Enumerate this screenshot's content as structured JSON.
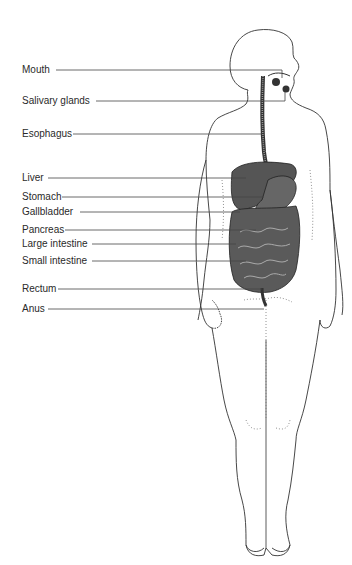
{
  "diagram": {
    "labels": [
      {
        "text": "Mouth",
        "y": 70,
        "x_end": 332
      },
      {
        "text": "Salivary glands",
        "y": 101,
        "x_end": 305
      },
      {
        "text": "Esophagus",
        "y": 134,
        "x_end": 266
      },
      {
        "text": "Liver",
        "y": 178,
        "x_end": 275
      },
      {
        "text": "Stomach",
        "y": 197,
        "x_end": 295
      },
      {
        "text": "Gallbladder",
        "y": 212,
        "x_end": 275
      },
      {
        "text": "Pancreas",
        "y": 230,
        "x_end": 300
      },
      {
        "text": "Large intestine",
        "y": 244,
        "x_end": 248
      },
      {
        "text": "Small intestine",
        "y": 261,
        "x_end": 270
      },
      {
        "text": "Rectum",
        "y": 289,
        "x_end": 262
      },
      {
        "text": "Anus",
        "y": 309,
        "x_end": 262
      }
    ]
  }
}
